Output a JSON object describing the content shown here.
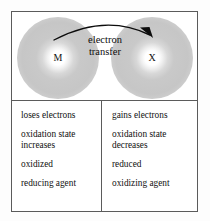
{
  "diagram": {
    "left_atom_label": "M",
    "right_atom_label": "X",
    "arrow_label_line1": "electron",
    "arrow_label_line2": "transfer",
    "arrow_direction": "left-to-right",
    "arrow_icon": "curved-arrow-icon",
    "cloud_color": "#c6c6c6",
    "frame_color": "#5b5b5b"
  },
  "table": {
    "columns": [
      {
        "name": "oxidation",
        "cells": [
          "loses electrons",
          "oxidation state\n  increases",
          "oxidized",
          "reducing agent"
        ]
      },
      {
        "name": "reduction",
        "cells": [
          "gains electrons",
          "oxidation state\n  decreases",
          "reduced",
          "oxidizing agent"
        ]
      }
    ]
  }
}
